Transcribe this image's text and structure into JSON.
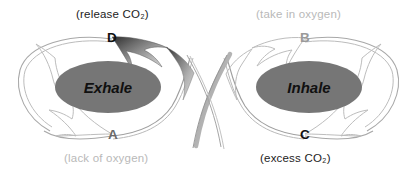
{
  "diagram": {
    "type": "cycle-diagram",
    "background_color": "#ffffff",
    "ellipse_fill": "#767676",
    "phases": [
      {
        "id": "exhale",
        "label": "Exhale",
        "side": "left"
      },
      {
        "id": "inhale",
        "label": "Inhale",
        "side": "right"
      }
    ],
    "nodes": [
      {
        "id": "D",
        "letter": "D",
        "position": "top-left",
        "color": "#111111",
        "emphasis": "dark"
      },
      {
        "id": "B",
        "letter": "B",
        "position": "top-right",
        "color": "#9a9a9a",
        "emphasis": "light"
      },
      {
        "id": "A",
        "letter": "A",
        "position": "bottom-left",
        "color": "#6a6a6a",
        "emphasis": "mid"
      },
      {
        "id": "C",
        "letter": "C",
        "position": "bottom-right",
        "color": "#111111",
        "emphasis": "dark"
      }
    ],
    "captions": [
      {
        "id": "release-co2",
        "text": "(release CO₂)",
        "for_node": "D",
        "position": "top-left",
        "color": "#1c1c1c",
        "emphasis": "dark"
      },
      {
        "id": "take-in-oxygen",
        "text": "(take in oxygen)",
        "for_node": "B",
        "position": "top-right",
        "color": "#b9b9b9",
        "emphasis": "light"
      },
      {
        "id": "lack-of-oxygen",
        "text": "(lack of oxygen)",
        "for_node": "A",
        "position": "bottom-left",
        "color": "#b9b9b9",
        "emphasis": "light"
      },
      {
        "id": "excess-co2",
        "text": "(excess CO₂)",
        "for_node": "C",
        "position": "bottom-right",
        "color": "#1c1c1c",
        "emphasis": "dark"
      }
    ],
    "arrows": [
      {
        "id": "arrow-to-d",
        "from": "C",
        "to": "D",
        "style": "filled-gradient",
        "direction": "up-left",
        "fill_dark": "#3c3c3c",
        "fill_light": "#d6d6d6"
      },
      {
        "id": "arrow-to-b",
        "from": "A",
        "to": "B",
        "style": "outline",
        "direction": "up-right",
        "stroke": "#bdbdbd"
      },
      {
        "id": "arrow-to-a",
        "from": "D",
        "to": "A",
        "style": "outline",
        "direction": "down-right",
        "stroke": "#bdbdbd"
      },
      {
        "id": "arrow-to-c",
        "from": "B",
        "to": "C",
        "style": "outline",
        "direction": "down-left",
        "stroke": "#bdbdbd"
      }
    ],
    "loops": [
      {
        "id": "left-loop",
        "label": "Exhale loop",
        "stroke": "#9a9a9a"
      },
      {
        "id": "right-loop",
        "label": "Inhale loop",
        "stroke": "#9a9a9a"
      }
    ]
  }
}
